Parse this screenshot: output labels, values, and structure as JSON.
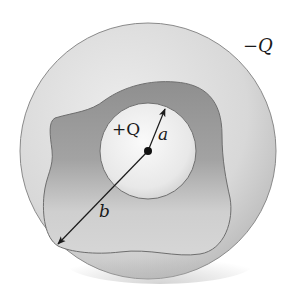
{
  "diagram": {
    "labels": {
      "inner_charge": "+Q",
      "outer_charge": "−Q",
      "radius_a": "a",
      "radius_b": "b"
    },
    "colors": {
      "background": "#ffffff",
      "outer_conductor": "#d9d9d9",
      "outer_conductor_edge": "#8a8a8a",
      "cavity": "#a6a6a6",
      "cavity_edge": "#6e6e6e",
      "inner_sphere": "#eeeeee",
      "inner_sphere_edge": "#707070",
      "arrow": "#1a1a1a"
    },
    "geometry": {
      "outer_circle": {
        "cx": 148,
        "cy": 151,
        "r": 128
      },
      "inner_sphere": {
        "cx": 148,
        "cy": 151,
        "r": 48
      },
      "center_dot": {
        "cx": 148,
        "cy": 151,
        "r": 3.5
      },
      "arrow_a": {
        "x1": 148,
        "y1": 151,
        "x2": 165,
        "y2": 108
      },
      "arrow_b": {
        "x1": 148,
        "y1": 151,
        "x2": 57,
        "y2": 245
      }
    }
  }
}
